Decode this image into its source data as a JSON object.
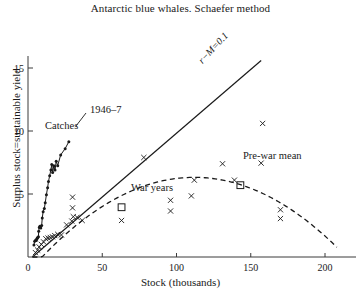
{
  "chart_data": {
    "type": "scatter",
    "title": "Antarctic blue whales. Schaefer method",
    "xlabel": "Stock (thousands)",
    "ylabel": "Surplus stock=sustainable yield",
    "xlim": [
      0,
      215
    ],
    "ylim": [
      0,
      15.6
    ],
    "xticks": [
      0,
      50,
      100,
      150,
      200
    ],
    "xticklabels": [
      "0",
      "50",
      "100",
      "150",
      "200"
    ],
    "yticks": [
      5,
      10,
      15
    ],
    "yticklabels": [
      "5",
      "10",
      "15"
    ],
    "grid": false,
    "legend": "none",
    "series": [
      {
        "name": "observations",
        "marker": "x",
        "points": [
          [
            5.0,
            0.35
          ],
          [
            6.5,
            0.55
          ],
          [
            7.5,
            0.8
          ],
          [
            9.0,
            1.0
          ],
          [
            10.5,
            1.2
          ],
          [
            12.0,
            1.45
          ],
          [
            13.5,
            1.5
          ],
          [
            15.0,
            1.55
          ],
          [
            16.5,
            1.6
          ],
          [
            18.0,
            1.7
          ],
          [
            20.0,
            1.8
          ],
          [
            22.5,
            1.75
          ],
          [
            26.0,
            2.55
          ],
          [
            29.5,
            2.85
          ],
          [
            30.5,
            3.2
          ],
          [
            33.0,
            3.15
          ],
          [
            36.5,
            2.9
          ],
          [
            30.0,
            4.75
          ],
          [
            30.0,
            3.9
          ],
          [
            63.0,
            2.9
          ],
          [
            78.0,
            7.9
          ],
          [
            96.0,
            4.5
          ],
          [
            96.0,
            3.65
          ],
          [
            110.0,
            4.85
          ],
          [
            112.0,
            6.1
          ],
          [
            131.0,
            7.4
          ],
          [
            139.0,
            6.1
          ],
          [
            157.0,
            7.45
          ],
          [
            158.0,
            10.6
          ],
          [
            170.0,
            3.75
          ],
          [
            170.0,
            3.05
          ]
        ]
      },
      {
        "name": "catches",
        "marker": "filled-dot-line",
        "points": [
          [
            4.0,
            0.95
          ],
          [
            4.5,
            1.25
          ],
          [
            5.2,
            1.35
          ],
          [
            5.6,
            1.3
          ],
          [
            6.0,
            1.45
          ],
          [
            6.3,
            1.5
          ],
          [
            6.6,
            1.55
          ],
          [
            7.0,
            1.6
          ],
          [
            7.2,
            2.05
          ],
          [
            7.6,
            2.35
          ],
          [
            8.0,
            2.45
          ],
          [
            8.6,
            2.3
          ],
          [
            9.2,
            2.5
          ],
          [
            9.6,
            3.1
          ],
          [
            10.2,
            3.6
          ],
          [
            11.0,
            3.85
          ],
          [
            11.6,
            4.3
          ],
          [
            12.4,
            4.95
          ],
          [
            13.2,
            5.5
          ],
          [
            13.8,
            6.0
          ],
          [
            14.6,
            6.45
          ],
          [
            15.4,
            6.9
          ],
          [
            16.0,
            7.35
          ],
          [
            16.6,
            6.7
          ],
          [
            17.4,
            7.25
          ],
          [
            18.2,
            6.9
          ],
          [
            19.0,
            7.6
          ],
          [
            20.0,
            7.25
          ],
          [
            22.0,
            8.1
          ],
          [
            25.0,
            8.6
          ],
          [
            27.5,
            9.15
          ]
        ]
      },
      {
        "name": "period means",
        "marker": "open-square",
        "points": [
          [
            63.0,
            3.95
          ],
          [
            143.0,
            5.7
          ]
        ]
      }
    ],
    "lines": [
      {
        "name": "r-M line",
        "style": "solid",
        "label": "r−M=0.1",
        "from": [
          3.0,
          0.0
        ],
        "to": [
          157.0,
          15.6
        ]
      },
      {
        "name": "schaefer parabola",
        "style": "dashed",
        "x_zero_left": 3.0,
        "x_zero_right": 208.0,
        "peak_x": 112.0,
        "peak_y": 6.32
      }
    ],
    "annotations": [
      {
        "name": "catches",
        "text": "Catches",
        "x": 9.5,
        "y": 8.1
      },
      {
        "name": "year-1946-7",
        "text": "1946–7",
        "x": 42.0,
        "y": 9.4
      },
      {
        "name": "war-years",
        "text": "War years",
        "x": 70.0,
        "y": 4.6
      },
      {
        "name": "pre-war-mean",
        "text": "Pre-war mean",
        "x": 146.0,
        "y": 6.7
      },
      {
        "name": "r-m-line-label",
        "text": "r−M=0.1",
        "x": 117.0,
        "y": 12.2
      }
    ]
  },
  "colors": {
    "ink": "#1a1a1a",
    "axis": "#3a3a3a",
    "background": "#ffffff"
  }
}
